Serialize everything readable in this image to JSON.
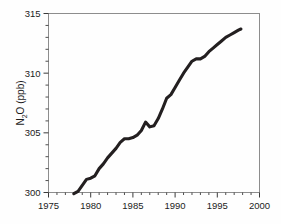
{
  "chart_data": {
    "type": "line",
    "title": "",
    "xlabel": "",
    "ylabel": "N2O (ppb)",
    "ylabel_parts": {
      "pre": "N",
      "sub": "2",
      "post": "O (ppb)"
    },
    "xlim": [
      1975,
      2000
    ],
    "ylim": [
      300,
      315
    ],
    "grid": false,
    "legend": null,
    "x_ticks": [
      1975,
      1980,
      1985,
      1990,
      1995,
      2000
    ],
    "x_tick_labels": [
      "1975",
      "1980",
      "1985",
      "1990",
      "1995",
      "2000"
    ],
    "x_minor_tick_interval": 1,
    "y_ticks": [
      300,
      305,
      310,
      315
    ],
    "y_tick_labels": [
      "300",
      "305",
      "310",
      "315"
    ],
    "y_minor_tick_interval": 1,
    "series": [
      {
        "name": "N2O",
        "color": "#231f20",
        "x": [
          1978.0,
          1978.5,
          1979.0,
          1979.5,
          1980.0,
          1980.5,
          1981.0,
          1981.5,
          1982.0,
          1982.5,
          1983.0,
          1983.5,
          1984.0,
          1984.5,
          1985.0,
          1985.5,
          1986.0,
          1986.5,
          1987.0,
          1987.5,
          1988.0,
          1988.5,
          1989.0,
          1989.5,
          1990.0,
          1990.5,
          1991.0,
          1991.5,
          1992.0,
          1992.5,
          1993.0,
          1993.5,
          1994.0,
          1994.5,
          1995.0,
          1995.5,
          1996.0,
          1996.5,
          1997.0,
          1997.5,
          1997.8
        ],
        "y": [
          299.9,
          300.1,
          300.6,
          301.1,
          301.2,
          301.4,
          302.0,
          302.4,
          302.9,
          303.3,
          303.7,
          304.2,
          304.5,
          304.5,
          304.6,
          304.8,
          305.2,
          305.9,
          305.5,
          305.6,
          306.2,
          307.0,
          307.9,
          308.2,
          308.8,
          309.4,
          310.0,
          310.5,
          311.0,
          311.2,
          311.2,
          311.4,
          311.8,
          312.1,
          312.4,
          312.7,
          313.0,
          313.2,
          313.4,
          313.6,
          313.7
        ]
      }
    ],
    "annotations": []
  }
}
